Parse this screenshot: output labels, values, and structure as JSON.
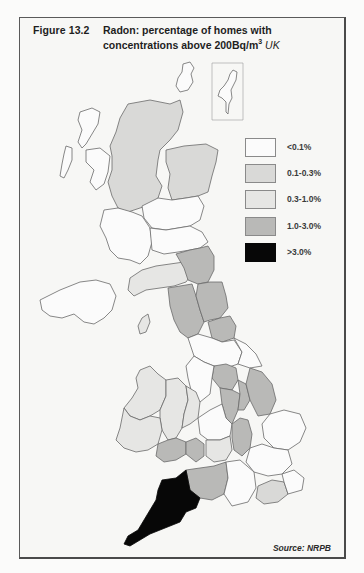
{
  "figure": {
    "number": "Figure 13.2",
    "title_main": "Radon: percentage of homes with concentrations above 200Bq/m",
    "title_sup": "3",
    "title_region": "UK",
    "source": "Source: NRPB"
  },
  "legend": {
    "items": [
      {
        "label": "<0.1%",
        "color": "#fbfbfb"
      },
      {
        "label": "0.1-0.3%",
        "color": "#d9d9d7"
      },
      {
        "label": "0.3-1.0%",
        "color": "#e6e6e4"
      },
      {
        "label": "1.0-3.0%",
        "color": "#b9b9b7"
      },
      {
        "label": ">3.0%",
        "color": "#070707"
      }
    ]
  },
  "map": {
    "outline_color": "#5a5a5a",
    "regions": [
      {
        "name": "Northern Scottish Highlands",
        "class": "0.1-0.3%"
      },
      {
        "name": "Grampian",
        "class": "0.1-0.3%"
      },
      {
        "name": "Western Isles / Orkney / Shetland",
        "class": "<0.1%"
      },
      {
        "name": "Central and southern Scotland",
        "class": "<0.1%"
      },
      {
        "name": "Dumfries & Galloway",
        "class": "0.3-1.0%"
      },
      {
        "name": "Northumberland",
        "class": "1.0-3.0%"
      },
      {
        "name": "Cumbria",
        "class": "1.0-3.0%"
      },
      {
        "name": "Durham / North Yorkshire",
        "class": "1.0-3.0%"
      },
      {
        "name": "Isle of Man",
        "class": "0.3-1.0%"
      },
      {
        "name": "Northern Ireland",
        "class": "<0.1%"
      },
      {
        "name": "Derbyshire / Notts / Lincs",
        "class": "1.0-3.0%"
      },
      {
        "name": "Wales (north and mid)",
        "class": "0.3-1.0%"
      },
      {
        "name": "South Wales",
        "class": "1.0-3.0%"
      },
      {
        "name": "Somerset / Dorset",
        "class": "1.0-3.0%"
      },
      {
        "name": "Northamptonshire",
        "class": "1.0-3.0%"
      },
      {
        "name": "Sussex",
        "class": "0.3-1.0%"
      },
      {
        "name": "Devon and Cornwall",
        "class": ">3.0%"
      },
      {
        "name": "East Anglia / South-east",
        "class": "<0.1%"
      }
    ]
  }
}
